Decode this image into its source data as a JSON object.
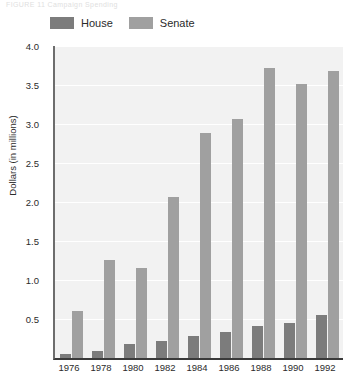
{
  "figure": {
    "caption": "FIGURE 11   Campaign Spending"
  },
  "legend": {
    "position": "top-left",
    "items": [
      {
        "label": "House",
        "color": "#7c7c7c",
        "icon": "legend-swatch-icon"
      },
      {
        "label": "Senate",
        "color": "#a0a0a0",
        "icon": "legend-swatch-icon"
      }
    ]
  },
  "chart_data": {
    "type": "bar",
    "title": "",
    "xlabel": "",
    "ylabel": "Dollars (in millions)",
    "categories": [
      "1976",
      "1978",
      "1980",
      "1982",
      "1984",
      "1986",
      "1988",
      "1990",
      "1992"
    ],
    "series": [
      {
        "name": "House",
        "color": "#7c7c7c",
        "values": [
          0.05,
          0.09,
          0.18,
          0.22,
          0.28,
          0.33,
          0.41,
          0.45,
          0.55
        ]
      },
      {
        "name": "Senate",
        "color": "#a0a0a0",
        "values": [
          0.6,
          1.26,
          1.15,
          2.07,
          2.89,
          3.06,
          3.72,
          3.51,
          3.68
        ]
      }
    ],
    "ylim": [
      0,
      4.0
    ],
    "yticks": [
      "0.5",
      "1.0",
      "1.5",
      "2.0",
      "2.5",
      "3.0",
      "3.5",
      "4.0"
    ],
    "ytick_values": [
      0.5,
      1.0,
      1.5,
      2.0,
      2.5,
      3.0,
      3.5,
      4.0
    ],
    "grid": true,
    "grid_color": "#ffffff",
    "plot_background": "#f2f2f2",
    "legend_position": "top-left"
  }
}
